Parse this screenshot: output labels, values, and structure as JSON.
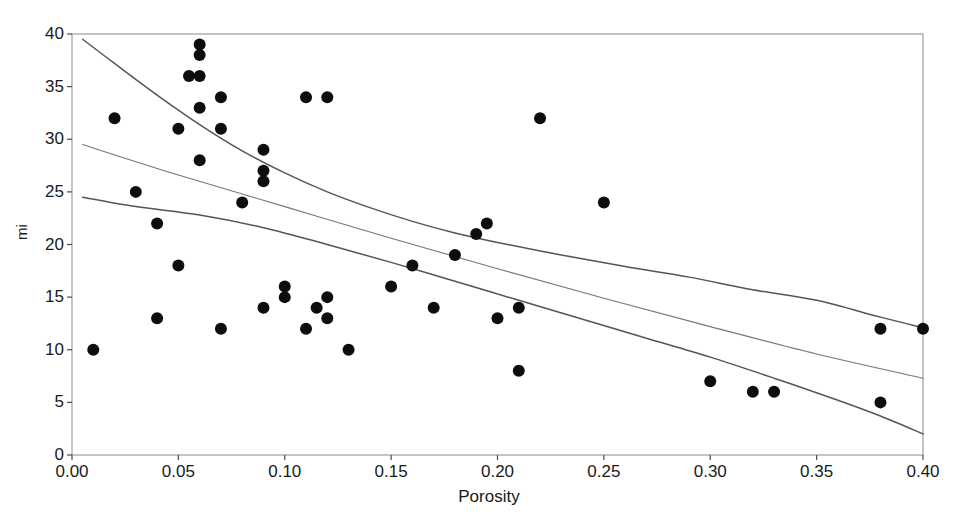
{
  "chart_data": {
    "type": "scatter",
    "title": "",
    "xlabel": "Porosity",
    "ylabel": "mi",
    "xlim": [
      0.0,
      0.4
    ],
    "ylim": [
      0,
      40
    ],
    "xticks": [
      "0.00",
      "0.05",
      "0.10",
      "0.15",
      "0.20",
      "0.25",
      "0.30",
      "0.35",
      "0.40"
    ],
    "xtick_values": [
      0.0,
      0.05,
      0.1,
      0.15,
      0.2,
      0.25,
      0.3,
      0.35,
      0.4
    ],
    "yticks": [
      "0",
      "5",
      "10",
      "15",
      "20",
      "25",
      "30",
      "35",
      "40"
    ],
    "ytick_values": [
      0,
      5,
      10,
      15,
      20,
      25,
      30,
      35,
      40
    ],
    "grid": false,
    "legend": "none",
    "marker": "filled-circle",
    "marker_color": "#0d0d0d",
    "marker_size": 6,
    "line_color": "#555555",
    "points": [
      {
        "x": 0.01,
        "y": 10
      },
      {
        "x": 0.02,
        "y": 32
      },
      {
        "x": 0.03,
        "y": 25
      },
      {
        "x": 0.04,
        "y": 22
      },
      {
        "x": 0.04,
        "y": 13
      },
      {
        "x": 0.05,
        "y": 31
      },
      {
        "x": 0.05,
        "y": 18
      },
      {
        "x": 0.055,
        "y": 36
      },
      {
        "x": 0.06,
        "y": 36
      },
      {
        "x": 0.06,
        "y": 39
      },
      {
        "x": 0.06,
        "y": 38
      },
      {
        "x": 0.06,
        "y": 33
      },
      {
        "x": 0.06,
        "y": 28
      },
      {
        "x": 0.07,
        "y": 34
      },
      {
        "x": 0.07,
        "y": 31
      },
      {
        "x": 0.07,
        "y": 12
      },
      {
        "x": 0.08,
        "y": 24
      },
      {
        "x": 0.09,
        "y": 29
      },
      {
        "x": 0.09,
        "y": 27
      },
      {
        "x": 0.09,
        "y": 26
      },
      {
        "x": 0.09,
        "y": 14
      },
      {
        "x": 0.1,
        "y": 16
      },
      {
        "x": 0.1,
        "y": 15
      },
      {
        "x": 0.11,
        "y": 34
      },
      {
        "x": 0.11,
        "y": 12
      },
      {
        "x": 0.115,
        "y": 14
      },
      {
        "x": 0.12,
        "y": 34
      },
      {
        "x": 0.12,
        "y": 15
      },
      {
        "x": 0.12,
        "y": 13
      },
      {
        "x": 0.13,
        "y": 10
      },
      {
        "x": 0.15,
        "y": 16
      },
      {
        "x": 0.16,
        "y": 18
      },
      {
        "x": 0.17,
        "y": 14
      },
      {
        "x": 0.18,
        "y": 19
      },
      {
        "x": 0.19,
        "y": 21
      },
      {
        "x": 0.195,
        "y": 22
      },
      {
        "x": 0.2,
        "y": 13
      },
      {
        "x": 0.21,
        "y": 14
      },
      {
        "x": 0.21,
        "y": 8
      },
      {
        "x": 0.22,
        "y": 32
      },
      {
        "x": 0.25,
        "y": 24
      },
      {
        "x": 0.3,
        "y": 7
      },
      {
        "x": 0.32,
        "y": 6
      },
      {
        "x": 0.33,
        "y": 6
      },
      {
        "x": 0.38,
        "y": 12
      },
      {
        "x": 0.38,
        "y": 5
      },
      {
        "x": 0.4,
        "y": 12
      }
    ],
    "curves": [
      {
        "name": "upper-confidence-bound",
        "points": [
          {
            "x": 0.005,
            "y": 39.5
          },
          {
            "x": 0.02,
            "y": 37.2
          },
          {
            "x": 0.04,
            "y": 34.2
          },
          {
            "x": 0.06,
            "y": 31.4
          },
          {
            "x": 0.08,
            "y": 28.9
          },
          {
            "x": 0.1,
            "y": 26.8
          },
          {
            "x": 0.12,
            "y": 25.0
          },
          {
            "x": 0.14,
            "y": 23.5
          },
          {
            "x": 0.16,
            "y": 22.2
          },
          {
            "x": 0.18,
            "y": 21.1
          },
          {
            "x": 0.2,
            "y": 20.2
          },
          {
            "x": 0.23,
            "y": 19.0
          },
          {
            "x": 0.26,
            "y": 17.9
          },
          {
            "x": 0.29,
            "y": 16.9
          },
          {
            "x": 0.32,
            "y": 15.7
          },
          {
            "x": 0.35,
            "y": 14.7
          },
          {
            "x": 0.38,
            "y": 13.1
          },
          {
            "x": 0.4,
            "y": 12.1
          }
        ]
      },
      {
        "name": "regression-line",
        "points": [
          {
            "x": 0.005,
            "y": 29.5
          },
          {
            "x": 0.05,
            "y": 26.6
          },
          {
            "x": 0.1,
            "y": 23.6
          },
          {
            "x": 0.15,
            "y": 20.6
          },
          {
            "x": 0.2,
            "y": 17.7
          },
          {
            "x": 0.25,
            "y": 14.9
          },
          {
            "x": 0.3,
            "y": 12.2
          },
          {
            "x": 0.35,
            "y": 9.6
          },
          {
            "x": 0.4,
            "y": 7.3
          }
        ]
      },
      {
        "name": "lower-confidence-bound",
        "points": [
          {
            "x": 0.005,
            "y": 24.5
          },
          {
            "x": 0.03,
            "y": 23.6
          },
          {
            "x": 0.06,
            "y": 22.8
          },
          {
            "x": 0.09,
            "y": 21.6
          },
          {
            "x": 0.12,
            "y": 20.0
          },
          {
            "x": 0.15,
            "y": 18.3
          },
          {
            "x": 0.18,
            "y": 16.5
          },
          {
            "x": 0.21,
            "y": 14.7
          },
          {
            "x": 0.24,
            "y": 12.9
          },
          {
            "x": 0.27,
            "y": 11.1
          },
          {
            "x": 0.3,
            "y": 9.3
          },
          {
            "x": 0.33,
            "y": 7.3
          },
          {
            "x": 0.36,
            "y": 5.2
          },
          {
            "x": 0.38,
            "y": 3.7
          },
          {
            "x": 0.4,
            "y": 2.0
          }
        ]
      }
    ]
  }
}
